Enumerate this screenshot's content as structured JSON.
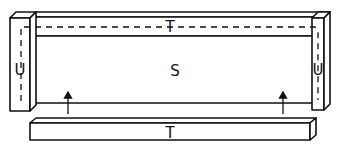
{
  "diagram": {
    "labels": {
      "top_beam": "T",
      "left_post": "U",
      "right_post": "U",
      "panel": "S",
      "bottom_beam": "T"
    },
    "colors": {
      "stroke": "#111111",
      "fill": "#ffffff"
    }
  }
}
